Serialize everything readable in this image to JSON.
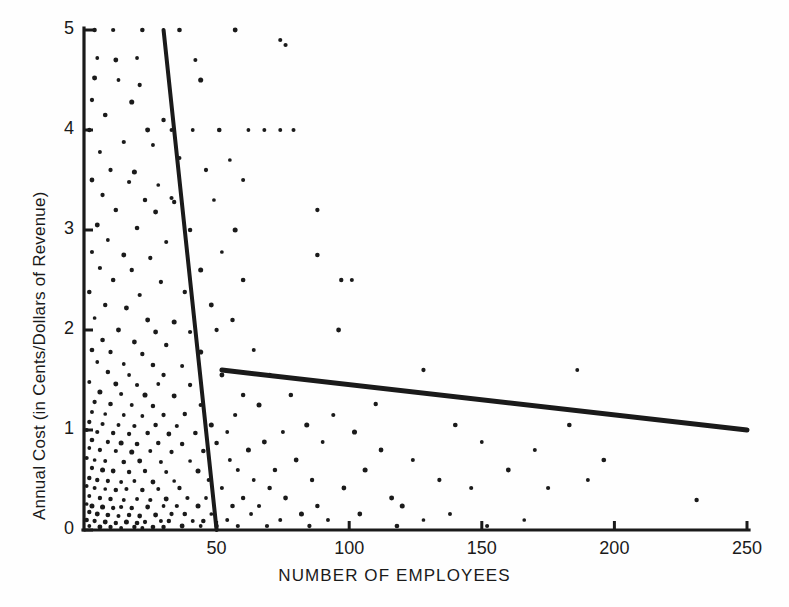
{
  "figure": {
    "title": "",
    "background_color": "#fefefe",
    "ink_color": "#1a1a1a"
  },
  "axes": {
    "x_title": "NUMBER OF EMPLOYEES",
    "y_title": "Annual Cost (in Cents/Dollars of Revenue)",
    "x_ticks": [
      "50",
      "100",
      "150",
      "200",
      "250"
    ],
    "y_ticks": [
      "5",
      "4",
      "3",
      "2",
      "1",
      "0"
    ]
  },
  "chart_data": {
    "type": "scatter",
    "title": "",
    "xlabel": "NUMBER OF EMPLOYEES",
    "ylabel": "Annual Cost (in Cents/Dollars of Revenue)",
    "xlim": [
      0,
      250
    ],
    "ylim": [
      0,
      5
    ],
    "xticks": [
      50,
      100,
      150,
      200,
      250
    ],
    "yticks": [
      0,
      1,
      2,
      3,
      4,
      5
    ],
    "grid": false,
    "legend": "none",
    "marker": {
      "shape": "circle",
      "color": "#1a1a1a",
      "size_px": 4
    },
    "series": [
      {
        "name": "Firms",
        "points": [
          [
            4,
            5.0
          ],
          [
            11,
            5.0
          ],
          [
            22,
            5.0
          ],
          [
            36,
            5.0
          ],
          [
            57,
            5.0
          ],
          [
            74,
            4.9
          ],
          [
            76,
            4.85
          ],
          [
            5,
            4.72
          ],
          [
            12,
            4.7
          ],
          [
            20,
            4.72
          ],
          [
            42,
            4.7
          ],
          [
            4,
            4.52
          ],
          [
            13,
            4.5
          ],
          [
            21,
            4.45
          ],
          [
            44,
            4.5
          ],
          [
            3,
            4.3
          ],
          [
            18,
            4.28
          ],
          [
            8,
            4.15
          ],
          [
            30,
            4.1
          ],
          [
            2,
            4.0
          ],
          [
            24,
            4.0
          ],
          [
            33,
            4.0
          ],
          [
            41,
            4.0
          ],
          [
            51,
            4.0
          ],
          [
            62,
            4.0
          ],
          [
            68,
            4.0
          ],
          [
            74,
            4.0
          ],
          [
            79,
            4.0
          ],
          [
            15,
            3.88
          ],
          [
            26,
            3.85
          ],
          [
            6,
            3.78
          ],
          [
            36,
            3.72
          ],
          [
            55,
            3.7
          ],
          [
            10,
            3.6
          ],
          [
            19,
            3.58
          ],
          [
            46,
            3.6
          ],
          [
            3,
            3.5
          ],
          [
            17,
            3.48
          ],
          [
            28,
            3.45
          ],
          [
            60,
            3.5
          ],
          [
            7,
            3.35
          ],
          [
            23,
            3.3
          ],
          [
            33,
            3.32
          ],
          [
            34,
            3.28
          ],
          [
            49,
            3.3
          ],
          [
            12,
            3.2
          ],
          [
            27,
            3.18
          ],
          [
            88,
            3.2
          ],
          [
            5,
            3.05
          ],
          [
            20,
            3.02
          ],
          [
            40,
            3.0
          ],
          [
            57,
            3.0
          ],
          [
            9,
            2.9
          ],
          [
            31,
            2.88
          ],
          [
            3,
            2.78
          ],
          [
            15,
            2.75
          ],
          [
            25,
            2.72
          ],
          [
            52,
            2.78
          ],
          [
            88,
            2.75
          ],
          [
            6,
            2.62
          ],
          [
            18,
            2.6
          ],
          [
            44,
            2.6
          ],
          [
            11,
            2.5
          ],
          [
            29,
            2.48
          ],
          [
            60,
            2.5
          ],
          [
            97,
            2.5
          ],
          [
            101,
            2.5
          ],
          [
            2,
            2.38
          ],
          [
            21,
            2.35
          ],
          [
            38,
            2.38
          ],
          [
            8,
            2.25
          ],
          [
            16,
            2.22
          ],
          [
            48,
            2.25
          ],
          [
            4,
            2.12
          ],
          [
            24,
            2.1
          ],
          [
            34,
            2.08
          ],
          [
            56,
            2.1
          ],
          [
            13,
            2.0
          ],
          [
            27,
            1.98
          ],
          [
            40,
            1.98
          ],
          [
            50,
            2.0
          ],
          [
            96,
            2.0
          ],
          [
            7,
            1.9
          ],
          [
            19,
            1.88
          ],
          [
            31,
            1.85
          ],
          [
            3,
            1.8
          ],
          [
            10,
            1.78
          ],
          [
            22,
            1.76
          ],
          [
            44,
            1.78
          ],
          [
            64,
            1.8
          ],
          [
            5,
            1.68
          ],
          [
            15,
            1.66
          ],
          [
            26,
            1.65
          ],
          [
            37,
            1.64
          ],
          [
            9,
            1.58
          ],
          [
            17,
            1.55
          ],
          [
            30,
            1.55
          ],
          [
            52,
            1.55
          ],
          [
            70,
            1.55
          ],
          [
            128,
            1.6
          ],
          [
            186,
            1.6
          ],
          [
            2,
            1.48
          ],
          [
            12,
            1.46
          ],
          [
            20,
            1.45
          ],
          [
            28,
            1.46
          ],
          [
            40,
            1.45
          ],
          [
            6,
            1.38
          ],
          [
            14,
            1.36
          ],
          [
            23,
            1.35
          ],
          [
            34,
            1.34
          ],
          [
            60,
            1.35
          ],
          [
            78,
            1.35
          ],
          [
            4,
            1.28
          ],
          [
            10,
            1.26
          ],
          [
            18,
            1.25
          ],
          [
            26,
            1.24
          ],
          [
            44,
            1.25
          ],
          [
            66,
            1.25
          ],
          [
            110,
            1.26
          ],
          [
            3,
            1.18
          ],
          [
            8,
            1.16
          ],
          [
            15,
            1.15
          ],
          [
            22,
            1.14
          ],
          [
            30,
            1.15
          ],
          [
            38,
            1.16
          ],
          [
            57,
            1.15
          ],
          [
            94,
            1.15
          ],
          [
            2,
            1.08
          ],
          [
            7,
            1.06
          ],
          [
            13,
            1.05
          ],
          [
            19,
            1.04
          ],
          [
            27,
            1.05
          ],
          [
            35,
            1.04
          ],
          [
            48,
            1.05
          ],
          [
            84,
            1.05
          ],
          [
            140,
            1.05
          ],
          [
            183,
            1.05
          ],
          [
            1,
            1.0
          ],
          [
            5,
            0.98
          ],
          [
            11,
            0.97
          ],
          [
            17,
            0.96
          ],
          [
            24,
            0.97
          ],
          [
            32,
            0.96
          ],
          [
            42,
            0.97
          ],
          [
            54,
            0.98
          ],
          [
            75,
            0.98
          ],
          [
            102,
            0.98
          ],
          [
            3,
            0.9
          ],
          [
            9,
            0.88
          ],
          [
            14,
            0.87
          ],
          [
            20,
            0.86
          ],
          [
            28,
            0.87
          ],
          [
            37,
            0.86
          ],
          [
            50,
            0.87
          ],
          [
            68,
            0.88
          ],
          [
            90,
            0.88
          ],
          [
            150,
            0.88
          ],
          [
            2,
            0.82
          ],
          [
            6,
            0.8
          ],
          [
            12,
            0.79
          ],
          [
            18,
            0.78
          ],
          [
            25,
            0.79
          ],
          [
            33,
            0.78
          ],
          [
            45,
            0.79
          ],
          [
            62,
            0.8
          ],
          [
            112,
            0.8
          ],
          [
            170,
            0.8
          ],
          [
            1,
            0.72
          ],
          [
            4,
            0.7
          ],
          [
            8,
            0.69
          ],
          [
            15,
            0.68
          ],
          [
            21,
            0.69
          ],
          [
            29,
            0.68
          ],
          [
            40,
            0.69
          ],
          [
            55,
            0.7
          ],
          [
            80,
            0.7
          ],
          [
            124,
            0.7
          ],
          [
            196,
            0.7
          ],
          [
            3,
            0.62
          ],
          [
            7,
            0.6
          ],
          [
            11,
            0.59
          ],
          [
            17,
            0.58
          ],
          [
            23,
            0.59
          ],
          [
            31,
            0.58
          ],
          [
            43,
            0.59
          ],
          [
            58,
            0.6
          ],
          [
            72,
            0.6
          ],
          [
            106,
            0.6
          ],
          [
            160,
            0.6
          ],
          [
            2,
            0.52
          ],
          [
            5,
            0.5
          ],
          [
            9,
            0.49
          ],
          [
            14,
            0.48
          ],
          [
            19,
            0.49
          ],
          [
            26,
            0.48
          ],
          [
            34,
            0.49
          ],
          [
            47,
            0.5
          ],
          [
            64,
            0.5
          ],
          [
            86,
            0.5
          ],
          [
            134,
            0.5
          ],
          [
            190,
            0.5
          ],
          [
            1,
            0.44
          ],
          [
            4,
            0.42
          ],
          [
            8,
            0.41
          ],
          [
            12,
            0.4
          ],
          [
            16,
            0.41
          ],
          [
            22,
            0.4
          ],
          [
            28,
            0.41
          ],
          [
            36,
            0.42
          ],
          [
            52,
            0.42
          ],
          [
            70,
            0.42
          ],
          [
            98,
            0.42
          ],
          [
            146,
            0.42
          ],
          [
            175,
            0.42
          ],
          [
            231,
            0.3
          ],
          [
            2,
            0.34
          ],
          [
            6,
            0.32
          ],
          [
            10,
            0.31
          ],
          [
            15,
            0.3
          ],
          [
            20,
            0.31
          ],
          [
            25,
            0.3
          ],
          [
            31,
            0.31
          ],
          [
            39,
            0.32
          ],
          [
            46,
            0.32
          ],
          [
            60,
            0.32
          ],
          [
            76,
            0.32
          ],
          [
            116,
            0.32
          ],
          [
            1,
            0.26
          ],
          [
            3,
            0.24
          ],
          [
            7,
            0.23
          ],
          [
            11,
            0.22
          ],
          [
            14,
            0.23
          ],
          [
            18,
            0.22
          ],
          [
            24,
            0.23
          ],
          [
            30,
            0.24
          ],
          [
            35,
            0.24
          ],
          [
            43,
            0.24
          ],
          [
            56,
            0.24
          ],
          [
            66,
            0.24
          ],
          [
            88,
            0.24
          ],
          [
            120,
            0.24
          ],
          [
            2,
            0.18
          ],
          [
            5,
            0.16
          ],
          [
            9,
            0.15
          ],
          [
            13,
            0.14
          ],
          [
            17,
            0.15
          ],
          [
            21,
            0.14
          ],
          [
            27,
            0.15
          ],
          [
            33,
            0.16
          ],
          [
            38,
            0.16
          ],
          [
            48,
            0.16
          ],
          [
            63,
            0.16
          ],
          [
            82,
            0.16
          ],
          [
            104,
            0.16
          ],
          [
            138,
            0.16
          ],
          [
            1,
            0.1
          ],
          [
            4,
            0.09
          ],
          [
            8,
            0.08
          ],
          [
            12,
            0.07
          ],
          [
            16,
            0.08
          ],
          [
            20,
            0.07
          ],
          [
            23,
            0.08
          ],
          [
            29,
            0.09
          ],
          [
            32,
            0.09
          ],
          [
            41,
            0.09
          ],
          [
            45,
            0.09
          ],
          [
            54,
            0.1
          ],
          [
            74,
            0.1
          ],
          [
            92,
            0.1
          ],
          [
            128,
            0.1
          ],
          [
            166,
            0.1
          ],
          [
            2,
            0.04
          ],
          [
            6,
            0.03
          ],
          [
            10,
            0.03
          ],
          [
            14,
            0.02
          ],
          [
            19,
            0.03
          ],
          [
            22,
            0.02
          ],
          [
            26,
            0.03
          ],
          [
            30,
            0.03
          ],
          [
            37,
            0.04
          ],
          [
            44,
            0.04
          ],
          [
            50,
            0.04
          ],
          [
            58,
            0.04
          ],
          [
            69,
            0.04
          ],
          [
            85,
            0.04
          ],
          [
            118,
            0.04
          ],
          [
            152,
            0.04
          ]
        ]
      }
    ],
    "fit_lines": [
      {
        "name": "steep-regression-line",
        "description": "Steep downward fitted line for small firms",
        "x_start": 30,
        "y_start": 5.0,
        "x_end": 50,
        "y_end": 0.0,
        "width_px": 4
      },
      {
        "name": "shallow-regression-line",
        "description": "Shallow downward fitted line for larger firms",
        "x_start": 52,
        "y_start": 1.6,
        "x_end": 250,
        "y_end": 1.0,
        "width_px": 5
      }
    ]
  }
}
